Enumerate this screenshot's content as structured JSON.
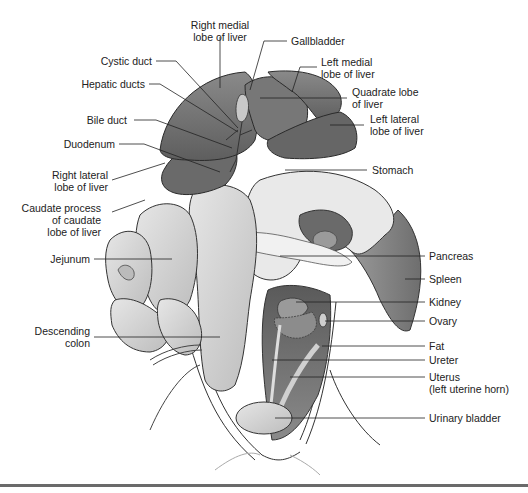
{
  "figure": {
    "labels_left": [
      {
        "id": "right-medial-lobe-of-liver",
        "text": "Right medial\nlobe of liver"
      },
      {
        "id": "cystic-duct",
        "text": "Cystic duct"
      },
      {
        "id": "hepatic-ducts",
        "text": "Hepatic ducts"
      },
      {
        "id": "bile-duct",
        "text": "Bile duct"
      },
      {
        "id": "duodenum",
        "text": "Duodenum"
      },
      {
        "id": "right-lateral-lobe-of-liver",
        "text": "Right lateral\nlobe of liver"
      },
      {
        "id": "caudate-process",
        "text": "Caudate process\nof caudate\nlobe of liver"
      },
      {
        "id": "jejunum",
        "text": "Jejunum"
      },
      {
        "id": "descending-colon",
        "text": "Descending\ncolon"
      }
    ],
    "labels_right": [
      {
        "id": "gallbladder",
        "text": "Gallbladder"
      },
      {
        "id": "left-medial-lobe-of-liver",
        "text": "Left medial\nlobe of liver"
      },
      {
        "id": "quadrate-lobe-of-liver",
        "text": "Quadrate lobe\nof liver"
      },
      {
        "id": "left-lateral-lobe-of-liver",
        "text": "Left lateral\nlobe of liver"
      },
      {
        "id": "stomach",
        "text": "Stomach"
      },
      {
        "id": "pancreas",
        "text": "Pancreas"
      },
      {
        "id": "spleen",
        "text": "Spleen"
      },
      {
        "id": "kidney",
        "text": "Kidney"
      },
      {
        "id": "ovary",
        "text": "Ovary"
      },
      {
        "id": "fat",
        "text": "Fat"
      },
      {
        "id": "ureter",
        "text": "Ureter"
      },
      {
        "id": "uterus",
        "text": "Uterus\n(left uterine horn)"
      },
      {
        "id": "urinary-bladder",
        "text": "Urinary bladder"
      }
    ]
  },
  "colors": {
    "liver": "#6e6e6e",
    "liver_dark": "#5a5a5a",
    "intestine": "#d8d8d8",
    "cavity": "#7a7a7a",
    "line": "#2a2a2a",
    "rule": "#6a6a6a"
  }
}
